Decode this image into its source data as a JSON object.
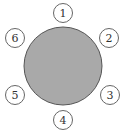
{
  "diagram": {
    "type": "round-table-seating",
    "table": {
      "cx": 63,
      "cy": 66,
      "r": 39,
      "fill": "#a9a9a9",
      "stroke": "#555555"
    },
    "seat_style": {
      "r": 9.5,
      "fill": "#ffffff",
      "stroke": "#666666"
    },
    "seats": [
      {
        "label": "1",
        "cx": 63,
        "cy": 13
      },
      {
        "label": "2",
        "cx": 109,
        "cy": 38
      },
      {
        "label": "3",
        "cx": 110,
        "cy": 95
      },
      {
        "label": "4",
        "cx": 63,
        "cy": 120
      },
      {
        "label": "5",
        "cx": 15,
        "cy": 95
      },
      {
        "label": "6",
        "cx": 15,
        "cy": 38
      }
    ]
  }
}
